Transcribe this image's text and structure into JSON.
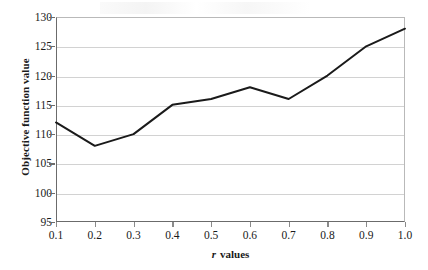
{
  "chart_data": {
    "type": "line",
    "title": "",
    "xlabel": "r values",
    "xlabel_variable": "r",
    "xlabel_rest": "values",
    "ylabel": "Objective function value",
    "x": [
      0.1,
      0.2,
      0.3,
      0.4,
      0.5,
      0.6,
      0.7,
      0.8,
      0.9,
      1.0
    ],
    "categories": [
      "0.1",
      "0.2",
      "0.3",
      "0.4",
      "0.5",
      "0.6",
      "0.7",
      "0.8",
      "0.9",
      "1.0"
    ],
    "values": [
      112,
      108,
      110,
      115,
      116,
      118,
      116,
      120,
      125,
      128
    ],
    "series": [
      {
        "name": "Objective function value",
        "values": [
          112,
          108,
          110,
          115,
          116,
          118,
          116,
          120,
          125,
          128
        ]
      }
    ],
    "ylim": [
      95,
      130
    ],
    "yticks": [
      95,
      100,
      105,
      110,
      115,
      120,
      125,
      130
    ],
    "ytick_labels": [
      "95",
      "100",
      "105",
      "110",
      "115",
      "120",
      "125",
      "130"
    ],
    "xlim": [
      0.1,
      1.0
    ],
    "grid": "horizontal",
    "legend": "none",
    "line_color": "#1a1a1a",
    "grid_color": "#d2d2d2",
    "axis_color": "#6b6b6b",
    "background": "#ffffff",
    "markers": "none"
  }
}
